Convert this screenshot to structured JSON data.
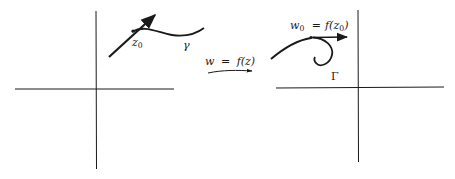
{
  "diagram": {
    "type": "conformal-mapping",
    "left_plane": {
      "curve_label": "γ",
      "point_label": "z",
      "point_subscript": "0"
    },
    "mapping": {
      "label_lhs": "w",
      "label_eq": "=",
      "label_rhs": "f(z)"
    },
    "right_plane": {
      "curve_label": "Γ",
      "point_label_lhs": "w",
      "point_label_lhs_subscript": "0",
      "point_label_eq": "=",
      "point_label_rhs_prefix": "f(z",
      "point_label_rhs_subscript": "0",
      "point_label_rhs_suffix": ")"
    },
    "colors": {
      "ink": "#1a1a1a",
      "background": "#ffffff"
    }
  }
}
